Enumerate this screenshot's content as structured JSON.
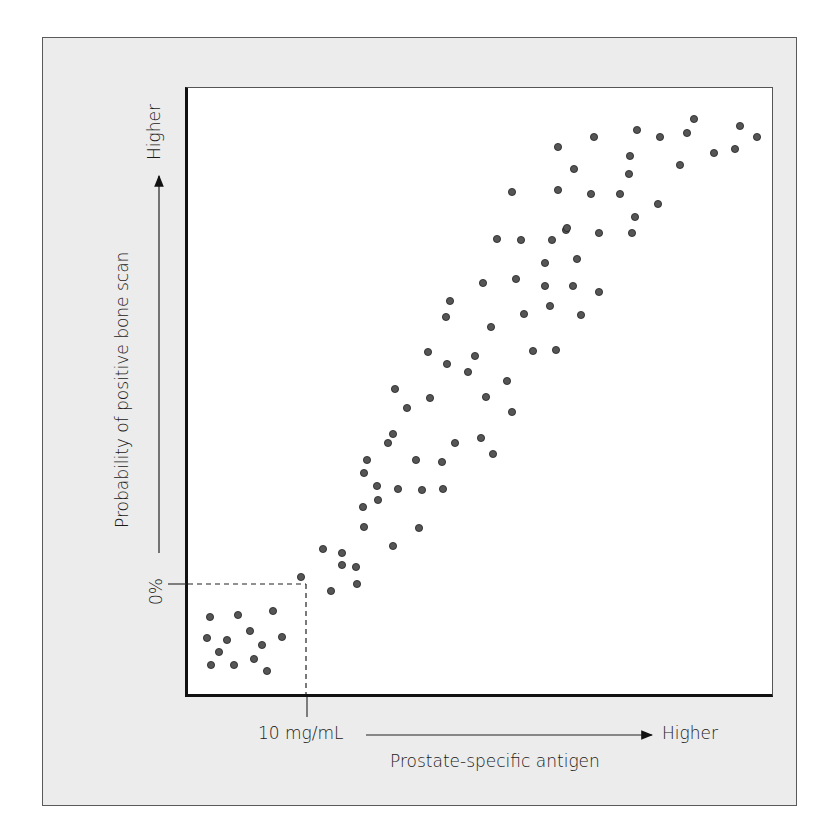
{
  "chart_data": {
    "type": "scatter",
    "title": "",
    "xlabel": "Prostate-specific antigen",
    "ylabel": "Probability of positive bone scan",
    "x_axis": {
      "tick_label": "10 mg/mL",
      "end_label": "Higher",
      "arrow": true
    },
    "y_axis": {
      "tick_label": "0%",
      "end_label": "Higher",
      "arrow": true
    },
    "grid": false,
    "legend": null,
    "annotations": [
      "Dashed reference lines from 10 mg/mL on x-axis and 0% on y-axis, forming a box in the lower-left corner"
    ],
    "marker_color": "#555555",
    "points_px": [
      [
        210,
        617
      ],
      [
        238,
        615
      ],
      [
        273,
        611
      ],
      [
        282,
        637
      ],
      [
        207,
        638
      ],
      [
        227,
        640
      ],
      [
        250,
        631
      ],
      [
        262,
        645
      ],
      [
        219,
        652
      ],
      [
        254,
        659
      ],
      [
        211,
        665
      ],
      [
        234,
        665
      ],
      [
        267,
        671
      ],
      [
        301,
        577
      ],
      [
        331,
        591
      ],
      [
        357,
        584
      ],
      [
        342,
        565
      ],
      [
        342,
        553
      ],
      [
        356,
        567
      ],
      [
        323,
        549
      ],
      [
        364,
        527
      ],
      [
        393,
        546
      ],
      [
        419,
        528
      ],
      [
        378,
        500
      ],
      [
        363,
        507
      ],
      [
        398,
        489
      ],
      [
        422,
        490
      ],
      [
        443,
        489
      ],
      [
        442,
        462
      ],
      [
        416,
        460
      ],
      [
        364,
        473
      ],
      [
        367,
        460
      ],
      [
        393,
        434
      ],
      [
        407,
        408
      ],
      [
        388,
        443
      ],
      [
        377,
        486
      ],
      [
        430,
        398
      ],
      [
        395,
        389
      ],
      [
        455,
        443
      ],
      [
        493,
        454
      ],
      [
        481,
        438
      ],
      [
        512,
        412
      ],
      [
        486,
        397
      ],
      [
        468,
        372
      ],
      [
        447,
        364
      ],
      [
        428,
        352
      ],
      [
        450,
        301
      ],
      [
        446,
        317
      ],
      [
        483,
        283
      ],
      [
        491,
        327
      ],
      [
        475,
        356
      ],
      [
        507,
        381
      ],
      [
        533,
        351
      ],
      [
        556,
        350
      ],
      [
        524,
        314
      ],
      [
        550,
        306
      ],
      [
        497,
        239
      ],
      [
        521,
        240
      ],
      [
        552,
        240
      ],
      [
        566,
        230
      ],
      [
        512,
        192
      ],
      [
        558,
        190
      ],
      [
        591,
        194
      ],
      [
        620,
        194
      ],
      [
        599,
        233
      ],
      [
        567,
        228
      ],
      [
        577,
        259
      ],
      [
        581,
        315
      ],
      [
        599,
        292
      ],
      [
        545,
        286
      ],
      [
        573,
        286
      ],
      [
        516,
        279
      ],
      [
        545,
        263
      ],
      [
        558,
        147
      ],
      [
        574,
        169
      ],
      [
        594,
        137
      ],
      [
        630,
        156
      ],
      [
        629,
        174
      ],
      [
        637,
        130
      ],
      [
        660,
        137
      ],
      [
        658,
        204
      ],
      [
        635,
        217
      ],
      [
        632,
        233
      ],
      [
        680,
        165
      ],
      [
        687,
        133
      ],
      [
        694,
        119
      ],
      [
        714,
        153
      ],
      [
        735,
        149
      ],
      [
        740,
        126
      ],
      [
        757,
        137
      ]
    ]
  },
  "labels": {
    "y_zero": "0%",
    "y_higher": "Higher",
    "y_title": "Probability of positive bone scan",
    "x_tick": "10 mg/mL",
    "x_higher": "Higher",
    "x_title": "Prostate-specific antigen"
  },
  "colors": {
    "frame_bg": "#ececec",
    "plot_bg": "#ffffff",
    "axis": "#111111",
    "marker": "#555555"
  }
}
